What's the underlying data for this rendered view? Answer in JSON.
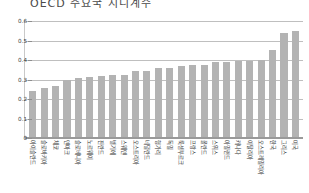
{
  "chart_data": {
    "type": "bar",
    "title": "OECD 주요국 지니계수",
    "subtitle": "",
    "xlabel": "",
    "ylabel": "",
    "ylim": [
      0,
      0.6
    ],
    "ytick_labels": [
      "0.6",
      "0.5",
      "0.4",
      "0.3",
      "0.2",
      "0.1",
      "0"
    ],
    "ytick_values": [
      0.6,
      0.5,
      0.4,
      0.3,
      0.2,
      0.1,
      0
    ],
    "grid": true,
    "legend": false,
    "legend_position": "none",
    "bar_color": "#b3b3b3",
    "categories": [
      "아이슬란드",
      "슬로바키아",
      "체코",
      "덴마크",
      "슬로베니아",
      "노르웨이",
      "핀란드",
      "벨기에",
      "스웨덴",
      "오스트리아",
      "네덜란드",
      "헝가리",
      "독일",
      "룩셈부르크",
      "프랑스",
      "폴란드",
      "스위스",
      "아일랜드",
      "캐나다",
      "이탈리아",
      "오스트레일리아",
      "한국",
      "그리스",
      "미국"
    ],
    "values": [
      0.241,
      0.257,
      0.269,
      0.295,
      0.31,
      0.311,
      0.32,
      0.322,
      0.322,
      0.345,
      0.345,
      0.357,
      0.36,
      0.37,
      0.372,
      0.375,
      0.39,
      0.392,
      0.393,
      0.395,
      0.4,
      0.45,
      0.538,
      0.55
    ]
  }
}
